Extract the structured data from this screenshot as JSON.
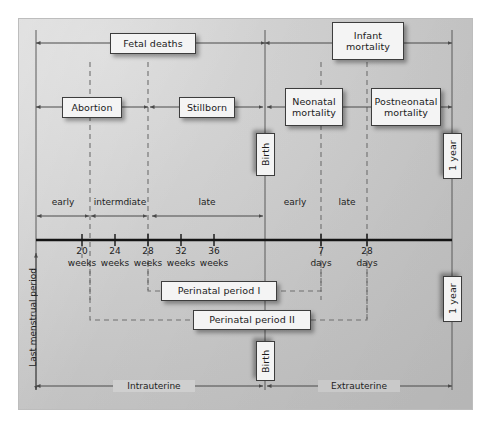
{
  "figure": {
    "type": "timeline-diagram"
  },
  "boxes": {
    "fetal_deaths": "Fetal deaths",
    "infant_mortality": "Infant\nmortality",
    "abortion": "Abortion",
    "stillborn": "Stillborn",
    "neonatal_mortality": "Neonatal\nmortality",
    "postneonatal_mortality": "Postneonatal\nmortality",
    "birth_top": "Birth",
    "birth_bottom": "Birth",
    "one_year_top": "1 year",
    "one_year_bottom": "1 year",
    "perinatal_period_1": "Perinatal period I",
    "perinatal_period_2": "Perinatal period II"
  },
  "stage_labels": {
    "early_fetal": "early",
    "intermediate_fetal": "intermdiate",
    "late_fetal": "late",
    "early_neonatal": "early",
    "late_neonatal": "late"
  },
  "axis": {
    "ticks": [
      {
        "value": "20",
        "unit": "weeks"
      },
      {
        "value": "24",
        "unit": "weeks"
      },
      {
        "value": "28",
        "unit": "weeks"
      },
      {
        "value": "32",
        "unit": "weeks"
      },
      {
        "value": "36",
        "unit": "weeks"
      },
      {
        "value": "7",
        "unit": "days"
      },
      {
        "value": "28",
        "unit": "days"
      }
    ]
  },
  "side_labels": {
    "last_menstrual_period": "Last menstrual period"
  },
  "bottom_labels": {
    "intrauterine": "Intrauterine",
    "extrauterine": "Extrauterine"
  },
  "colors": {
    "panel_light": "#d9d9d9",
    "panel_dark": "#bebebe",
    "line": "#4a4a4a",
    "axis": "#1a1a1a",
    "dashed": "#6b6b6b",
    "box_fill": "#f4f4f4",
    "box_border": "#3d3d3d",
    "text": "#1b1b1b"
  }
}
